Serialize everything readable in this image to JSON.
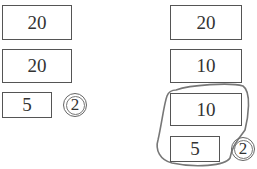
{
  "left_column": {
    "boxes": [
      {
        "value": "20"
      },
      {
        "value": "20"
      },
      {
        "value": "5"
      }
    ],
    "circled_count": "2"
  },
  "right_column": {
    "boxes": [
      {
        "value": "20"
      },
      {
        "value": "10"
      },
      {
        "value": "10"
      },
      {
        "value": "5"
      }
    ],
    "circled_count": "2",
    "grouping_loop": "freehand loop around 10 and 5 boxes"
  }
}
